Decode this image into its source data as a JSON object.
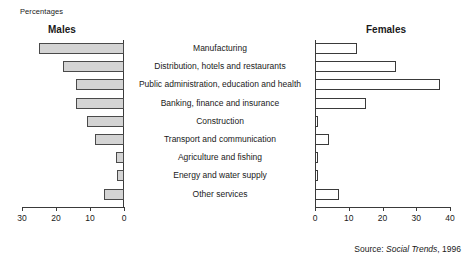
{
  "units_label": "Percentages",
  "source": {
    "prefix": "Source:",
    "publication": "Social Trends",
    "suffix": ", 1996"
  },
  "panels": {
    "left_title": "Males",
    "right_title": "Females"
  },
  "chart_data": {
    "type": "bar",
    "title": "Percentages",
    "orientation": "horizontal",
    "layout": "back-to-back pyramid, shared centred category labels",
    "xlabel": "",
    "ylabel": "",
    "grid": false,
    "legend": "none",
    "categories": [
      "Manufacturing",
      "Distribution, hotels and restaurants",
      "Public administration, education and health",
      "Banking, finance and insurance",
      "Construction",
      "Transport and communication",
      "Agriculture and fishing",
      "Energy and water supply",
      "Other services"
    ],
    "series": [
      {
        "name": "Males",
        "side": "left",
        "axis_reversed": true,
        "xlim": [
          0,
          30
        ],
        "ticks": [
          30,
          20,
          10,
          0
        ],
        "fill": "#d4d4d4",
        "stroke": "#4a4a4a",
        "values": [
          25,
          18,
          14,
          14,
          11,
          8.5,
          2.5,
          2,
          6
        ]
      },
      {
        "name": "Females",
        "side": "right",
        "axis_reversed": false,
        "xlim": [
          0,
          40
        ],
        "ticks": [
          0,
          10,
          20,
          30,
          40
        ],
        "fill": "#ffffff",
        "stroke": "#3a3a3a",
        "values": [
          12.5,
          24,
          37,
          15,
          1,
          4,
          1,
          0.7,
          7
        ]
      }
    ],
    "source_note": "Source: Social Trends, 1996"
  }
}
